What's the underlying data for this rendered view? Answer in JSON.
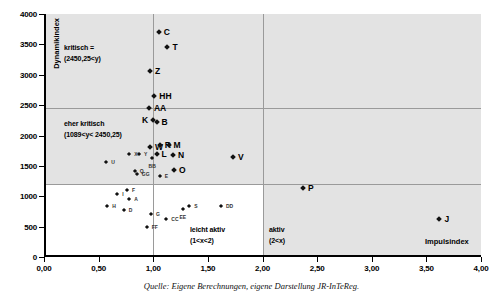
{
  "source_caption": "Quelle: Eigene Berechnungen, eigene Darstellung JR-InTeReg.",
  "colors": {
    "shaded_band": "#e3e3e3",
    "gridline": "#9a9a9a",
    "axis": "#000000",
    "marker": "#111111",
    "background": "#ffffff"
  },
  "annotations": {
    "kritisch_line1": "kritisch =",
    "kritisch_line2": "(2450,25<y)",
    "eher_kritisch_line1": "eher kritisch",
    "eher_kritisch_line2": "(1089<y< 2450,25)",
    "leicht_aktiv_line1": "leicht aktiv",
    "leicht_aktiv_line2": "(1<x<2)",
    "aktiv_line1": "aktiv",
    "aktiv_line2": "(2<x)"
  },
  "chart_data": {
    "type": "scatter",
    "title": "",
    "xlabel": "Impulsindex",
    "ylabel": "Dynamikindex",
    "xlim": [
      0,
      4
    ],
    "ylim": [
      0,
      4000
    ],
    "xticks": [
      0,
      0.5,
      1.0,
      1.5,
      2.0,
      2.5,
      3.0,
      3.5,
      4.0
    ],
    "xticklabels": [
      "0,00",
      "0,50",
      "1,00",
      "1,50",
      "2,00",
      "2,50",
      "3,00",
      "3,50",
      "4,00"
    ],
    "yticks": [
      0,
      500,
      1000,
      1500,
      2000,
      2500,
      3000,
      3500,
      4000
    ],
    "yticklabels": [
      "0",
      "500",
      "1000",
      "1500",
      "2000",
      "2500",
      "3000",
      "3500",
      "4000"
    ],
    "grid": false,
    "legend": "none",
    "threshold_lines": {
      "y_kritisch": 2450.25,
      "y_eher_kritisch": 1089,
      "x_aktiv": 2.0,
      "x_leicht_aktiv": 1.0
    },
    "points": [
      {
        "label": "C",
        "x": 1.05,
        "y": 3700,
        "size": "big",
        "label_pos": "right"
      },
      {
        "label": "T",
        "x": 1.13,
        "y": 3450,
        "size": "big",
        "label_pos": "right"
      },
      {
        "label": "Z",
        "x": 0.97,
        "y": 3060,
        "size": "big",
        "label_pos": "right"
      },
      {
        "label": "HH",
        "x": 1.01,
        "y": 2650,
        "size": "big",
        "label_pos": "right"
      },
      {
        "label": "AA",
        "x": 0.96,
        "y": 2450,
        "size": "big",
        "label_pos": "right"
      },
      {
        "label": "K",
        "x": 1.0,
        "y": 2260,
        "size": "big",
        "label_pos": "left"
      },
      {
        "label": "B",
        "x": 1.03,
        "y": 2230,
        "size": "big",
        "label_pos": "right"
      },
      {
        "label": "W",
        "x": 0.97,
        "y": 1810,
        "size": "big",
        "label_pos": "right"
      },
      {
        "label": "R",
        "x": 1.06,
        "y": 1840,
        "size": "big",
        "label_pos": "right"
      },
      {
        "label": "M",
        "x": 1.14,
        "y": 1840,
        "size": "big",
        "label_pos": "right"
      },
      {
        "label": "L",
        "x": 1.03,
        "y": 1700,
        "size": "big",
        "label_pos": "right"
      },
      {
        "label": "N",
        "x": 1.18,
        "y": 1680,
        "size": "big",
        "label_pos": "right"
      },
      {
        "label": "O",
        "x": 1.19,
        "y": 1430,
        "size": "big",
        "label_pos": "right"
      },
      {
        "label": "V",
        "x": 1.73,
        "y": 1650,
        "size": "big",
        "label_pos": "right"
      },
      {
        "label": "P",
        "x": 2.37,
        "y": 1130,
        "size": "big",
        "label_pos": "right"
      },
      {
        "label": "J",
        "x": 3.62,
        "y": 620,
        "size": "big",
        "label_pos": "right"
      },
      {
        "label": "U",
        "x": 0.57,
        "y": 1565,
        "size": "small",
        "label_pos": "right"
      },
      {
        "label": "X",
        "x": 0.78,
        "y": 1700,
        "size": "small",
        "label_pos": "right"
      },
      {
        "label": "Y",
        "x": 0.87,
        "y": 1690,
        "size": "small",
        "label_pos": "right"
      },
      {
        "label": "BB",
        "x": 0.99,
        "y": 1625,
        "size": "small",
        "label_pos": "below"
      },
      {
        "label": "Q",
        "x": 0.83,
        "y": 1420,
        "size": "small",
        "label_pos": "right"
      },
      {
        "label": "GG",
        "x": 0.85,
        "y": 1370,
        "size": "small",
        "label_pos": "right"
      },
      {
        "label": "E",
        "x": 1.06,
        "y": 1330,
        "size": "small",
        "label_pos": "right"
      },
      {
        "label": "F",
        "x": 0.76,
        "y": 1110,
        "size": "small",
        "label_pos": "right"
      },
      {
        "label": "I",
        "x": 0.67,
        "y": 1035,
        "size": "small",
        "label_pos": "right"
      },
      {
        "label": "A",
        "x": 0.78,
        "y": 960,
        "size": "small",
        "label_pos": "right"
      },
      {
        "label": "H",
        "x": 0.58,
        "y": 835,
        "size": "small",
        "label_pos": "right"
      },
      {
        "label": "D",
        "x": 0.73,
        "y": 775,
        "size": "small",
        "label_pos": "right"
      },
      {
        "label": "G",
        "x": 0.98,
        "y": 700,
        "size": "small",
        "label_pos": "right"
      },
      {
        "label": "FF",
        "x": 0.94,
        "y": 500,
        "size": "small",
        "label_pos": "right"
      },
      {
        "label": "CC",
        "x": 1.12,
        "y": 625,
        "size": "small",
        "label_pos": "right"
      },
      {
        "label": "EE",
        "x": 1.27,
        "y": 790,
        "size": "small",
        "label_pos": "below"
      },
      {
        "label": "S",
        "x": 1.33,
        "y": 845,
        "size": "small",
        "label_pos": "right"
      },
      {
        "label": "DD",
        "x": 1.62,
        "y": 835,
        "size": "small",
        "label_pos": "right"
      }
    ]
  }
}
